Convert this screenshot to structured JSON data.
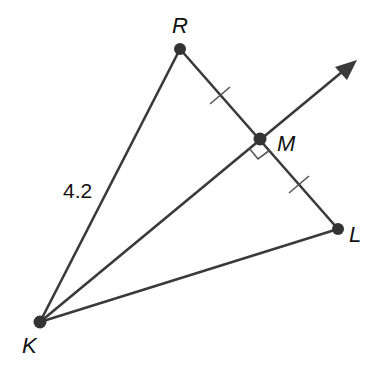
{
  "diagram": {
    "type": "geometry-triangle-perpendicular-bisector",
    "points": {
      "R": {
        "label": "R",
        "x": 180,
        "y": 49
      },
      "M": {
        "label": "M",
        "x": 260,
        "y": 139
      },
      "L": {
        "label": "L",
        "x": 338,
        "y": 229
      },
      "K": {
        "label": "K",
        "x": 40,
        "y": 322
      }
    },
    "segments": [
      "KR",
      "RL",
      "KL",
      "KM-ray"
    ],
    "ray": {
      "from": "K",
      "through": "M",
      "tip_x": 357,
      "tip_y": 60
    },
    "measurements": {
      "KR": "4.2"
    },
    "markings": {
      "congruent_ticks": [
        "RM",
        "ML"
      ],
      "right_angle_at": "M"
    },
    "colors": {
      "line": "#3a3a3a",
      "point": "#333333",
      "text": "#111111"
    }
  }
}
